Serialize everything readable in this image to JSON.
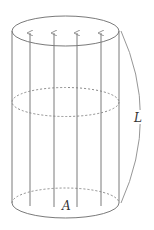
{
  "diagram": {
    "type": "cylinder-flux",
    "labels": {
      "length": "L",
      "area": "A"
    },
    "colors": {
      "stroke": "#7a7a7a",
      "dashed": "#8a8a8a",
      "text": "#333333",
      "background": "#ffffff"
    },
    "cylinder": {
      "left_x": 12,
      "right_x": 119,
      "top_center_y": 31,
      "mid_center_y": 102,
      "bottom_center_y": 203,
      "rx": 53.5,
      "ry": 15
    },
    "field_lines": {
      "count": 4,
      "x": [
        30,
        54,
        77,
        101
      ],
      "top_y": 33,
      "bottom_y": 203
    }
  }
}
